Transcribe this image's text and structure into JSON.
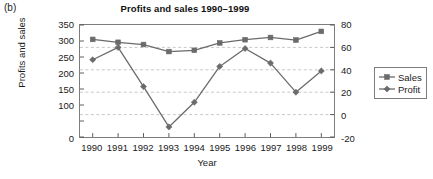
{
  "panel": {
    "label": "(b)"
  },
  "chart_data": {
    "type": "line",
    "title": "Profits and sales 1990–1999",
    "xlabel": "Year",
    "ylabel": "Profits and sales",
    "ylabel_right": "",
    "grid": true,
    "legend_position": "right",
    "categories": [
      "1990",
      "1991",
      "1992",
      "1993",
      "1994",
      "1995",
      "1996",
      "1997",
      "1998",
      "1999"
    ],
    "x": [
      1990,
      1991,
      1992,
      1993,
      1994,
      1995,
      1996,
      1997,
      1998,
      1999
    ],
    "yticks_left": [
      "0",
      "100",
      "150",
      "200",
      "250",
      "300",
      "350"
    ],
    "yticks_left_values": [
      0,
      100,
      150,
      200,
      250,
      300,
      350
    ],
    "ylim": [
      0,
      350
    ],
    "yticks_right": [
      "-20",
      "0",
      "20",
      "40",
      "60",
      "80"
    ],
    "yticks_right_values": [
      -20,
      0,
      20,
      40,
      60,
      80
    ],
    "ylim_right": [
      -20,
      80
    ],
    "series": [
      {
        "name": "Sales",
        "axis": "left",
        "marker": "square",
        "color": "#6b6b6b",
        "values": [
          305,
          296,
          289,
          267,
          271,
          294,
          304,
          311,
          303,
          330
        ]
      },
      {
        "name": "Profit",
        "axis": "right",
        "marker": "diamond",
        "color": "#6b6b6b",
        "values": [
          49,
          60,
          25,
          -11,
          11,
          43,
          59,
          46,
          20,
          39
        ]
      }
    ]
  }
}
